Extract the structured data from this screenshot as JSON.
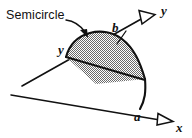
{
  "figure": {
    "background_color": "#ffffff",
    "ink_color": "#111111",
    "fill_pattern": "stipple-checkerboard-gray",
    "callout": {
      "text": "Semicircle",
      "leader": "curved-arrow-to-shaded-region",
      "arrowhead": "solid"
    },
    "axes": [
      {
        "name": "x-axis",
        "label": "x",
        "direction": "down-right",
        "arrowhead": "open-triangle"
      },
      {
        "name": "y-axis",
        "label": "y",
        "direction": "up-right",
        "arrowhead": "open-triangle"
      }
    ],
    "dimension_labels": [
      {
        "name": "b",
        "text": "b",
        "meaning": "y-axis intercept of semicircle diameter"
      },
      {
        "name": "a",
        "text": "a",
        "meaning": "x-axis intercept of semicircle diameter"
      },
      {
        "name": "y-inner",
        "text": "y",
        "meaning": "label at left vertex of semicircle diameter"
      }
    ]
  }
}
